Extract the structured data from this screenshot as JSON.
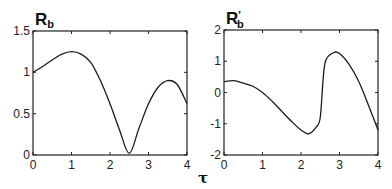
{
  "chart_data": [
    {
      "type": "line",
      "title": "R_b",
      "title_main": "R",
      "title_sub": "b",
      "title_prime": "",
      "xlabel": "",
      "ylabel": "",
      "xlim": [
        0,
        4
      ],
      "ylim": [
        0,
        1.5
      ],
      "xticks": [
        "0",
        "1",
        "2",
        "3",
        "4"
      ],
      "yticks": [
        "0",
        "0.5",
        "1",
        "1.5"
      ],
      "grid": false,
      "series": [
        {
          "name": "R_b",
          "x": [
            0,
            0.25,
            0.5,
            0.75,
            1.0,
            1.25,
            1.5,
            1.75,
            2.0,
            2.25,
            2.5,
            2.75,
            3.0,
            3.25,
            3.5,
            3.75,
            4.0
          ],
          "y": [
            1.0,
            1.07,
            1.15,
            1.22,
            1.25,
            1.22,
            1.12,
            0.9,
            0.62,
            0.3,
            0.02,
            0.32,
            0.62,
            0.82,
            0.9,
            0.85,
            0.62
          ]
        }
      ]
    },
    {
      "type": "line",
      "title": "R'_b",
      "title_main": "R",
      "title_sub": "b",
      "title_prime": "'",
      "xlabel": "τ",
      "ylabel": "",
      "xlim": [
        0,
        4
      ],
      "ylim": [
        -2,
        2
      ],
      "xticks": [
        "0",
        "1",
        "2",
        "3",
        "4"
      ],
      "yticks": [
        "-2",
        "-1",
        "0",
        "1",
        "2"
      ],
      "grid": false,
      "series": [
        {
          "name": "R'_b",
          "x": [
            0,
            0.25,
            0.5,
            0.75,
            1.0,
            1.25,
            1.5,
            1.75,
            2.0,
            2.2,
            2.4,
            2.5,
            2.58,
            2.65,
            2.85,
            3.0,
            3.25,
            3.5,
            3.75,
            4.0
          ],
          "y": [
            0.35,
            0.38,
            0.3,
            0.2,
            0.0,
            -0.28,
            -0.6,
            -0.92,
            -1.2,
            -1.32,
            -1.1,
            -0.8,
            0.5,
            1.05,
            1.28,
            1.25,
            0.9,
            0.35,
            -0.4,
            -1.2
          ]
        }
      ]
    }
  ]
}
